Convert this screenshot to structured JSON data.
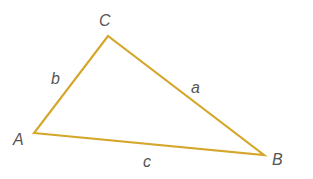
{
  "diagram": {
    "type": "triangle",
    "stroke_color": "#D4A62A",
    "vertices": [
      {
        "name": "A",
        "x": 34,
        "y": 133
      },
      {
        "name": "B",
        "x": 264,
        "y": 155
      },
      {
        "name": "C",
        "x": 108,
        "y": 36
      }
    ],
    "vertex_labels": {
      "A": "A",
      "B": "B",
      "C": "C"
    },
    "side_labels": {
      "a": "a",
      "b": "b",
      "c": "c"
    }
  }
}
